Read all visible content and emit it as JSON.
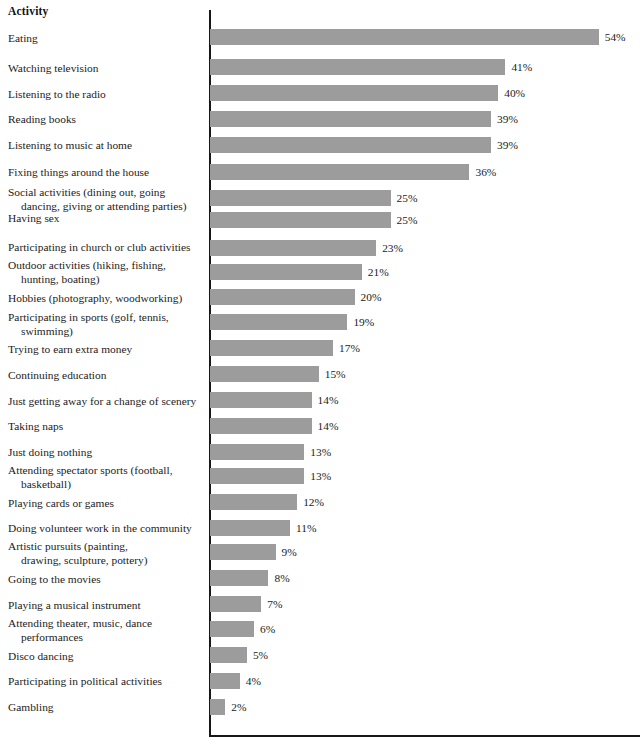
{
  "header": {
    "column_title": "Activity"
  },
  "colors": {
    "bar_fill": "#9c9c9c",
    "axis": "#15171a",
    "text": "#1b1b1b",
    "background": "#ffffff"
  },
  "chart_data": {
    "type": "bar",
    "orientation": "horizontal",
    "title": "",
    "subtitle": "",
    "xlabel": "",
    "ylabel": "Activity",
    "grid": false,
    "legend": null,
    "xlim": [
      0,
      60
    ],
    "value_suffix": "%",
    "categories": [
      "Eating",
      "Watching television",
      "Listening to the radio",
      "Reading books",
      "Listening to music at home",
      "Fixing things around the house",
      "Social activities (dining out, going dancing, giving or attending parties)",
      "Having sex",
      "Participating in church or club activities",
      "Outdoor activities (hiking, fishing, hunting, boating)",
      "Hobbies (photography, woodworking)",
      "Participating in sports (golf, tennis, swimming)",
      "Trying to earn extra money",
      "Continuing education",
      "Just getting away for a change of scenery",
      "Taking naps",
      "Just doing nothing",
      "Attending spectator sports (football, basketball)",
      "Playing cards or games",
      "Doing volunteer work in the community",
      "Artistic pursuits (painting, drawing, sculpture, pottery)",
      "Going to the movies",
      "Playing a musical instrument",
      "Attending theater, music, dance performances",
      "Disco dancing",
      "Participating in political activities",
      "Gambling"
    ],
    "values": [
      54,
      41,
      40,
      39,
      39,
      36,
      25,
      25,
      23,
      21,
      20,
      19,
      17,
      15,
      14,
      14,
      13,
      13,
      12,
      11,
      9,
      8,
      7,
      6,
      5,
      4,
      2
    ],
    "data_labels": [
      "54%",
      "41%",
      "40%",
      "39%",
      "39%",
      "36%",
      "25%",
      "25%",
      "23%",
      "21%",
      "20%",
      "19%",
      "17%",
      "15%",
      "14%",
      "14%",
      "13%",
      "13%",
      "12%",
      "11%",
      "9%",
      "8%",
      "7%",
      "6%",
      "5%",
      "4%",
      "2%"
    ]
  },
  "rows": [
    {
      "lines": [
        "Eating"
      ],
      "value": 54,
      "label": "54%",
      "label_top": 32,
      "bar_top": 29
    },
    {
      "lines": [
        "Watching television"
      ],
      "value": 41,
      "label": "41%",
      "label_top": 62,
      "bar_top": 59
    },
    {
      "lines": [
        "Listening to the radio"
      ],
      "value": 40,
      "label": "40%",
      "label_top": 88,
      "bar_top": 85
    },
    {
      "lines": [
        "Reading books"
      ],
      "value": 39,
      "label": "39%",
      "label_top": 113,
      "bar_top": 111
    },
    {
      "lines": [
        "Listening to music at home"
      ],
      "value": 39,
      "label": "39%",
      "label_top": 139,
      "bar_top": 137
    },
    {
      "lines": [
        "Fixing things around the house"
      ],
      "value": 36,
      "label": "36%",
      "label_top": 166,
      "bar_top": 164
    },
    {
      "lines": [
        "Social activities (dining out, going",
        "dancing, giving or attending parties)"
      ],
      "value": 25,
      "label": "25%",
      "label_top": 186,
      "bar_top": 190
    },
    {
      "lines": [
        "Having sex"
      ],
      "value": 25,
      "label": "25%",
      "label_top": 212,
      "bar_top": 212
    },
    {
      "lines": [
        "Participating in church or club activities"
      ],
      "value": 23,
      "label": "23%",
      "label_top": 241,
      "bar_top": 240
    },
    {
      "lines": [
        "Outdoor activities (hiking, fishing,",
        "hunting, boating)"
      ],
      "value": 21,
      "label": "21%",
      "label_top": 259,
      "bar_top": 264
    },
    {
      "lines": [
        "Hobbies (photography, woodworking)"
      ],
      "value": 20,
      "label": "20%",
      "label_top": 292,
      "bar_top": 289
    },
    {
      "lines": [
        "Participating in sports (golf, tennis,",
        "swimming)"
      ],
      "value": 19,
      "label": "19%",
      "label_top": 311,
      "bar_top": 314
    },
    {
      "lines": [
        "Trying to earn extra money"
      ],
      "value": 17,
      "label": "17%",
      "label_top": 343,
      "bar_top": 340
    },
    {
      "lines": [
        "Continuing education"
      ],
      "value": 15,
      "label": "15%",
      "label_top": 369,
      "bar_top": 366
    },
    {
      "lines": [
        "Just getting away for a change of scenery"
      ],
      "value": 14,
      "label": "14%",
      "label_top": 395,
      "bar_top": 392
    },
    {
      "lines": [
        "Taking naps"
      ],
      "value": 14,
      "label": "14%",
      "label_top": 420,
      "bar_top": 418
    },
    {
      "lines": [
        "Just doing nothing"
      ],
      "value": 13,
      "label": "13%",
      "label_top": 446,
      "bar_top": 444
    },
    {
      "lines": [
        "Attending spectator sports (football,",
        "basketball)"
      ],
      "value": 13,
      "label": "13%",
      "label_top": 464,
      "bar_top": 468
    },
    {
      "lines": [
        "Playing cards or games"
      ],
      "value": 12,
      "label": "12%",
      "label_top": 497,
      "bar_top": 494
    },
    {
      "lines": [
        "Doing volunteer work in the community"
      ],
      "value": 11,
      "label": "11%",
      "label_top": 522,
      "bar_top": 520
    },
    {
      "lines": [
        "Artistic pursuits (painting,",
        "drawing, sculpture, pottery)"
      ],
      "value": 9,
      "label": "9%",
      "label_top": 540,
      "bar_top": 544
    },
    {
      "lines": [
        "Going to the movies"
      ],
      "value": 8,
      "label": "8%",
      "label_top": 573,
      "bar_top": 570
    },
    {
      "lines": [
        "Playing a musical instrument"
      ],
      "value": 7,
      "label": "7%",
      "label_top": 599,
      "bar_top": 596
    },
    {
      "lines": [
        "Attending theater, music, dance",
        "performances"
      ],
      "value": 6,
      "label": "6%",
      "label_top": 617,
      "bar_top": 621
    },
    {
      "lines": [
        "Disco dancing"
      ],
      "value": 5,
      "label": "5%",
      "label_top": 650,
      "bar_top": 647
    },
    {
      "lines": [
        "Participating in political activities"
      ],
      "value": 4,
      "label": "4%",
      "label_top": 675,
      "bar_top": 673
    },
    {
      "lines": [
        "Gambling"
      ],
      "value": 2,
      "label": "2%",
      "label_top": 701,
      "bar_top": 699
    }
  ]
}
